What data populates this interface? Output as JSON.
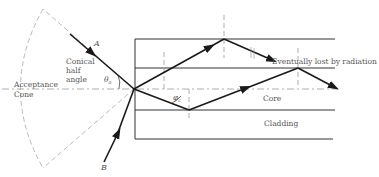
{
  "figure": {
    "type": "optical-fiber-acceptance-cone-diagram",
    "labels": {
      "ray_a": "A",
      "ray_b": "B",
      "conical_line1": "Conical",
      "conical_line2": "half",
      "conical_line3": "angle",
      "theta": "θ",
      "theta_sub": "a",
      "phi": "φ",
      "phi_sub": "c",
      "acceptance_line1": "Acceptance",
      "acceptance_line2": "Cone",
      "radiation": "Eventually lost by radiation",
      "core": "Core",
      "cladding": "Cladding"
    },
    "colors": {
      "ray": "#1a1a1a",
      "boundary": "#333333",
      "dashed": "#9a9a9a",
      "text": "#555555"
    }
  }
}
